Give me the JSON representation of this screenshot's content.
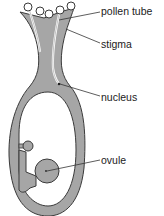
{
  "diagram": {
    "colors": {
      "tissue": "#a6a6a6",
      "outline": "#3a3a3a",
      "background": "#ffffff",
      "pollen_fill": "#ffffff"
    },
    "labels": [
      {
        "id": "pollen-tube",
        "text": "pollen tube",
        "x": 101,
        "y": 5
      },
      {
        "id": "stigma",
        "text": "stigma",
        "x": 101,
        "y": 38
      },
      {
        "id": "nucleus",
        "text": "nucleus",
        "x": 101,
        "y": 92
      },
      {
        "id": "ovule",
        "text": "ovule",
        "x": 101,
        "y": 155
      }
    ],
    "pollen_grain_count": 5
  }
}
